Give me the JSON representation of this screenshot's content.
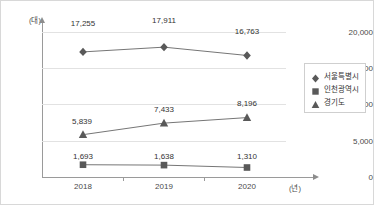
{
  "chart_data": {
    "type": "line",
    "title": "",
    "xlabel": "(년)",
    "ylabel": "(대)",
    "categories": [
      "2018",
      "2019",
      "2020"
    ],
    "ylim": [
      0,
      20000
    ],
    "yticks": [
      "0",
      "5,000",
      "10,000",
      "15,000",
      "20,000"
    ],
    "ytick_values": [
      0,
      5000,
      10000,
      15000,
      20000
    ],
    "grid": true,
    "legend_position": "right",
    "series": [
      {
        "name": "서울특별시",
        "marker": "diamond",
        "color": "#595959",
        "values": [
          17255,
          17911,
          16763
        ],
        "labels": [
          "17,255",
          "17,911",
          "16,763"
        ]
      },
      {
        "name": "인천광역시",
        "marker": "square",
        "color": "#595959",
        "values": [
          1693,
          1638,
          1310
        ],
        "labels": [
          "1,693",
          "1,638",
          "1,310"
        ]
      },
      {
        "name": "경기도",
        "marker": "triangle",
        "color": "#595959",
        "values": [
          5839,
          7433,
          8196
        ],
        "labels": [
          "5,839",
          "7,433",
          "8,196"
        ]
      }
    ]
  },
  "colors": {
    "line": "#767676",
    "marker": "#595959",
    "grid": "#e2e2e2",
    "axis": "#9a9a9a",
    "text": "#4a4a4a",
    "border": "#d8d8d8"
  }
}
